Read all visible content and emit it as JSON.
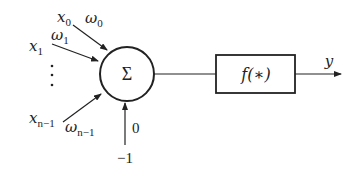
{
  "diagram": {
    "type": "neuron-model",
    "inputs": [
      {
        "x": "x",
        "x_sub": "0",
        "w": "ω",
        "w_sub": "0"
      },
      {
        "x": "x",
        "x_sub": "1",
        "w": "ω",
        "w_sub": "1"
      },
      {
        "x": "x",
        "x_sub": "n−1",
        "w": "ω",
        "w_sub": "n−1"
      }
    ],
    "ellipsis": "⋮",
    "summation_symbol": "Σ",
    "threshold": {
      "value": "0",
      "input": "−1"
    },
    "activation_label": "f(∗)",
    "output_label": "y",
    "colors": {
      "line": "#222222",
      "background": "#ffffff"
    }
  }
}
